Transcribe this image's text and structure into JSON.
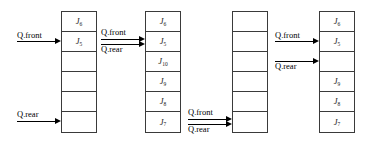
{
  "figure": {
    "cell_count": 6,
    "ink_color": "#000000",
    "box_color": "#3a3a3a",
    "background": "#ffffff"
  },
  "labels": {
    "front": "Q.front",
    "rear": "Q.rear"
  },
  "queues": [
    {
      "id": "queue-1",
      "cells": [
        {
          "text": "J",
          "sub": "6"
        },
        {
          "text": "J",
          "sub": "5"
        },
        {
          "text": "",
          "sub": ""
        },
        {
          "text": "",
          "sub": ""
        },
        {
          "text": "",
          "sub": ""
        },
        {
          "text": "",
          "sub": ""
        }
      ],
      "pointers": [
        {
          "name": "front",
          "label": "Q.front",
          "cell_index": 1
        },
        {
          "name": "rear",
          "label": "Q.rear",
          "cell_index": 5
        }
      ]
    },
    {
      "id": "queue-2",
      "cells": [
        {
          "text": "J",
          "sub": "6"
        },
        {
          "text": "J",
          "sub": "5"
        },
        {
          "text": "J",
          "sub": "10"
        },
        {
          "text": "J",
          "sub": "9"
        },
        {
          "text": "J",
          "sub": "8"
        },
        {
          "text": "J",
          "sub": "7"
        }
      ],
      "pointers": [
        {
          "name": "front",
          "label": "Q.front",
          "cell_index": 1
        },
        {
          "name": "rear",
          "label": "Q.rear",
          "cell_index": 1
        }
      ]
    },
    {
      "id": "queue-3",
      "cells": [
        {
          "text": "",
          "sub": ""
        },
        {
          "text": "",
          "sub": ""
        },
        {
          "text": "",
          "sub": ""
        },
        {
          "text": "",
          "sub": ""
        },
        {
          "text": "",
          "sub": ""
        },
        {
          "text": "",
          "sub": ""
        }
      ],
      "pointers": [
        {
          "name": "front",
          "label": "Q.front",
          "cell_index": 5
        },
        {
          "name": "rear",
          "label": "Q.rear",
          "cell_index": 5
        }
      ]
    },
    {
      "id": "queue-4",
      "cells": [
        {
          "text": "J",
          "sub": "6"
        },
        {
          "text": "J",
          "sub": "5"
        },
        {
          "text": "",
          "sub": ""
        },
        {
          "text": "J",
          "sub": "9"
        },
        {
          "text": "J",
          "sub": "8"
        },
        {
          "text": "J",
          "sub": "7"
        }
      ],
      "pointers": [
        {
          "name": "front",
          "label": "Q.front",
          "cell_index": 1
        },
        {
          "name": "rear",
          "label": "Q.rear",
          "cell_index": 2
        }
      ]
    }
  ]
}
